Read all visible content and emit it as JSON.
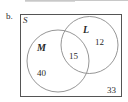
{
  "part_label": "b.",
  "universal_set": {
    "label": "S",
    "outside_value": "33"
  },
  "sets": [
    {
      "name": "M",
      "only_value": "40"
    },
    {
      "name": "L",
      "only_value": "12"
    }
  ],
  "intersection_value": "15",
  "colors": {
    "stroke": "#8a8a8a",
    "frame": "#555555",
    "text": "#2a2a2a"
  }
}
